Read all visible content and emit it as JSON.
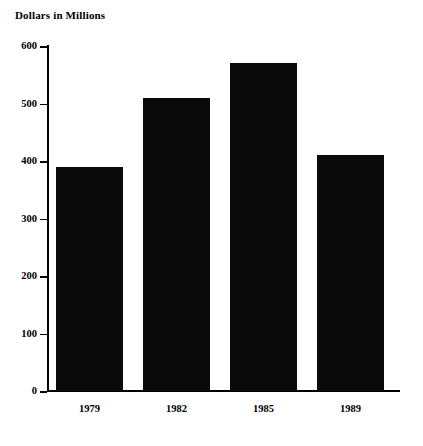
{
  "chart_data": {
    "type": "bar",
    "title": "Dollars in Millions",
    "xlabel": "",
    "ylabel": "",
    "categories": [
      "1979",
      "1982",
      "1985",
      "1989"
    ],
    "values": [
      390,
      510,
      570,
      410
    ],
    "series": [
      {
        "name": "Dollars in Millions",
        "values": [
          390,
          510,
          570,
          410
        ]
      }
    ],
    "ylim": [
      0,
      600
    ],
    "yticks": [
      0,
      100,
      200,
      300,
      400,
      500,
      600
    ],
    "ytick_labels": [
      "0",
      "100",
      "200",
      "300",
      "400",
      "500",
      "600"
    ],
    "grid": false,
    "legend": "none",
    "bar_color": "#0a0a0a",
    "axis_color": "#000000",
    "background_color": "#ffffff"
  }
}
